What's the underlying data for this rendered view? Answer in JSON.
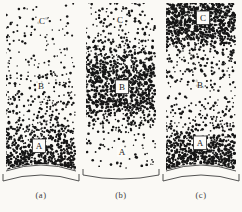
{
  "figure": {
    "background_color": "#faf9f5",
    "ink_color": "#161616",
    "line_color": "#404040",
    "panels": [
      {
        "caption": "(a)",
        "bottom_style": "convex-arc-with-bracket",
        "zone_labels": [
          {
            "text": "C",
            "x": 40,
            "y": 19,
            "boxed": false
          },
          {
            "text": "B",
            "x": 39,
            "y": 84,
            "boxed": false
          },
          {
            "text": "A",
            "x": 37,
            "y": 144,
            "boxed": true
          }
        ],
        "density_profile": [
          [
            0,
            0.07
          ],
          [
            0.25,
            0.1
          ],
          [
            0.5,
            0.16
          ],
          [
            0.68,
            0.26
          ],
          [
            0.8,
            0.45
          ],
          [
            0.9,
            0.65
          ],
          [
            0.95,
            0.8
          ],
          [
            1,
            0.85
          ]
        ],
        "seed": 7
      },
      {
        "caption": "(b)",
        "bottom_style": "concave-bracket",
        "zone_labels": [
          {
            "text": "C",
            "x": 38,
            "y": 18,
            "boxed": false
          },
          {
            "text": "B",
            "x": 40,
            "y": 85,
            "boxed": true
          },
          {
            "text": "A",
            "x": 40,
            "y": 150,
            "boxed": false
          }
        ],
        "density_profile": [
          [
            0,
            0.13
          ],
          [
            0.18,
            0.18
          ],
          [
            0.3,
            0.4
          ],
          [
            0.4,
            0.68
          ],
          [
            0.6,
            0.68
          ],
          [
            0.68,
            0.35
          ],
          [
            0.76,
            0.13
          ],
          [
            0.88,
            0.1
          ],
          [
            1,
            0.07
          ]
        ],
        "seed": 13
      },
      {
        "caption": "(c)",
        "bottom_style": "convex-arc-with-bracket",
        "zone_labels": [
          {
            "text": "C",
            "x": 41,
            "y": 16,
            "boxed": true
          },
          {
            "text": "B",
            "x": 38,
            "y": 83,
            "boxed": false
          },
          {
            "text": "A",
            "x": 38,
            "y": 141,
            "boxed": true
          }
        ],
        "density_profile": [
          [
            0,
            0.75
          ],
          [
            0.2,
            0.75
          ],
          [
            0.25,
            0.28
          ],
          [
            0.45,
            0.16
          ],
          [
            0.6,
            0.15
          ],
          [
            0.7,
            0.22
          ],
          [
            0.78,
            0.45
          ],
          [
            0.86,
            0.7
          ],
          [
            0.96,
            0.8
          ],
          [
            1,
            0.72
          ]
        ],
        "seed": 29
      }
    ]
  }
}
